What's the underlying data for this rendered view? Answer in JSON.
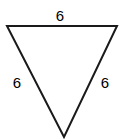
{
  "figure": {
    "name": "inverted-equilateral-triangle",
    "orientation": "point-down",
    "stroke_color": "#1a1a1a",
    "fill_color": "none",
    "background_color": "#ffffff",
    "stroke_width": 2,
    "vertices": {
      "top_left": {
        "x": 7,
        "y": 26
      },
      "top_right": {
        "x": 117,
        "y": 26
      },
      "bottom_apex": {
        "x": 64,
        "y": 137
      }
    },
    "labels": {
      "top": "6",
      "left": "6",
      "right": "6"
    }
  }
}
